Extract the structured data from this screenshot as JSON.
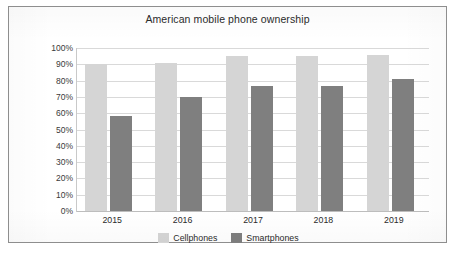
{
  "chart_data": {
    "type": "bar",
    "title": "American mobile phone ownership",
    "xlabel": "",
    "ylabel": "",
    "categories": [
      "2015",
      "2016",
      "2017",
      "2018",
      "2019"
    ],
    "series": [
      {
        "name": "Cellphones",
        "color": "#d5d5d5",
        "values": [
          90,
          91,
          95,
          95,
          96
        ]
      },
      {
        "name": "Smartphones",
        "color": "#7f7f7f",
        "values": [
          58,
          70,
          77,
          77,
          81
        ]
      }
    ],
    "ylim": [
      0,
      100
    ],
    "ytick_labels": [
      "100%",
      "90%",
      "80%",
      "70%",
      "60%",
      "50%",
      "40%",
      "30%",
      "20%",
      "10%",
      "0%"
    ],
    "ytick_values": [
      100,
      90,
      80,
      70,
      60,
      50,
      40,
      30,
      20,
      10,
      0
    ],
    "grid": true,
    "legend_position": "bottom",
    "frame_color": "#8e8e8e",
    "gridline_color": "#d9d9d9",
    "background": "#ffffff"
  }
}
